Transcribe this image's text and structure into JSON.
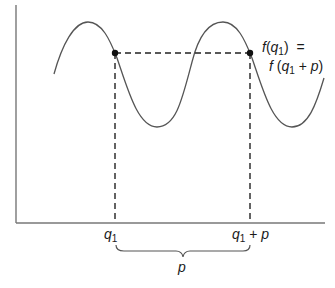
{
  "diagram": {
    "annotation": {
      "line1": {
        "f": "f",
        "open": "(",
        "q": "q",
        "sub": "1",
        "close": ")",
        "eq": "="
      },
      "line2": {
        "f": "f",
        "open": "(",
        "q": "q",
        "sub": "1",
        "plus": "+",
        "p": "p",
        "close": ")"
      }
    },
    "axis_labels": {
      "q1": {
        "q": "q",
        "sub": "1"
      },
      "q1_plus_p": {
        "q": "q",
        "sub": "1",
        "plus": "+",
        "p": "p"
      }
    },
    "brace_label": "p",
    "points": [
      {
        "name": "f(q1)",
        "x": 115,
        "y": 53
      },
      {
        "name": "f(q1 + p)",
        "x": 250,
        "y": 53
      }
    ],
    "colors": {
      "curve": "#555555",
      "axis": "#666666",
      "dashes": "#222222",
      "dot": "#111111"
    }
  }
}
